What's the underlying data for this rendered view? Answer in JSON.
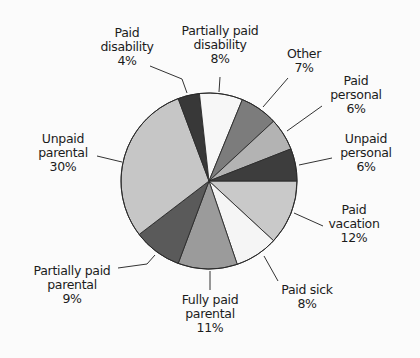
{
  "chart_data": {
    "type": "pie",
    "title": "",
    "start_angle_deg": 0,
    "direction": "clockwise",
    "center": [
      209,
      181
    ],
    "radius": 88,
    "slices": [
      {
        "key": "paid_vacation",
        "label": "Paid vacation",
        "value": 12,
        "pct": "12%",
        "color": "#c9c9c9"
      },
      {
        "key": "paid_sick",
        "label": "Paid sick",
        "value": 8,
        "pct": "8%",
        "color": "#f5f5f5"
      },
      {
        "key": "fully_paid_parental",
        "label": "Fully paid parental",
        "value": 11,
        "pct": "11%",
        "color": "#9b9b9b"
      },
      {
        "key": "partially_paid_parental",
        "label": "Partially paid parental",
        "value": 9,
        "pct": "9%",
        "color": "#5a5a5a"
      },
      {
        "key": "unpaid_parental",
        "label": "Unpaid parental",
        "value": 30,
        "pct": "30%",
        "color": "#c6c6c6"
      },
      {
        "key": "paid_disability",
        "label": "Paid disability",
        "value": 4,
        "pct": "4%",
        "color": "#383838"
      },
      {
        "key": "partially_paid_disability",
        "label": "Partially paid disability",
        "value": 8,
        "pct": "8%",
        "color": "#f7f7f7"
      },
      {
        "key": "other",
        "label": "Other",
        "value": 7,
        "pct": "7%",
        "color": "#7c7c7c"
      },
      {
        "key": "paid_personal",
        "label": "Paid personal",
        "value": 6,
        "pct": "6%",
        "color": "#b3b3b3"
      },
      {
        "key": "unpaid_personal",
        "label": "Unpaid personal",
        "value": 6,
        "pct": "6%",
        "color": "#3d3d3d"
      }
    ]
  },
  "labels": {
    "paid_disability": {
      "line1": "Paid",
      "line2": "disability",
      "pct": "4%"
    },
    "partially_paid_disability": {
      "line1": "Partially paid",
      "line2": "disability",
      "pct": "8%"
    },
    "other": {
      "line1": "Other",
      "pct": "7%"
    },
    "paid_personal": {
      "line1": "Paid",
      "line2": "personal",
      "pct": "6%"
    },
    "unpaid_personal": {
      "line1": "Unpaid",
      "line2": "personal",
      "pct": "6%"
    },
    "paid_vacation": {
      "line1": "Paid",
      "line2": "vacation",
      "pct": "12%"
    },
    "paid_sick": {
      "line1": "Paid sick",
      "pct": "8%"
    },
    "fully_paid_parental": {
      "line1": "Fully paid",
      "line2": "parental",
      "pct": "11%"
    },
    "partially_paid_parental": {
      "line1": "Partially paid",
      "line2": "parental",
      "pct": "9%"
    },
    "unpaid_parental": {
      "line1": "Unpaid",
      "line2": "parental",
      "pct": "30%"
    }
  }
}
